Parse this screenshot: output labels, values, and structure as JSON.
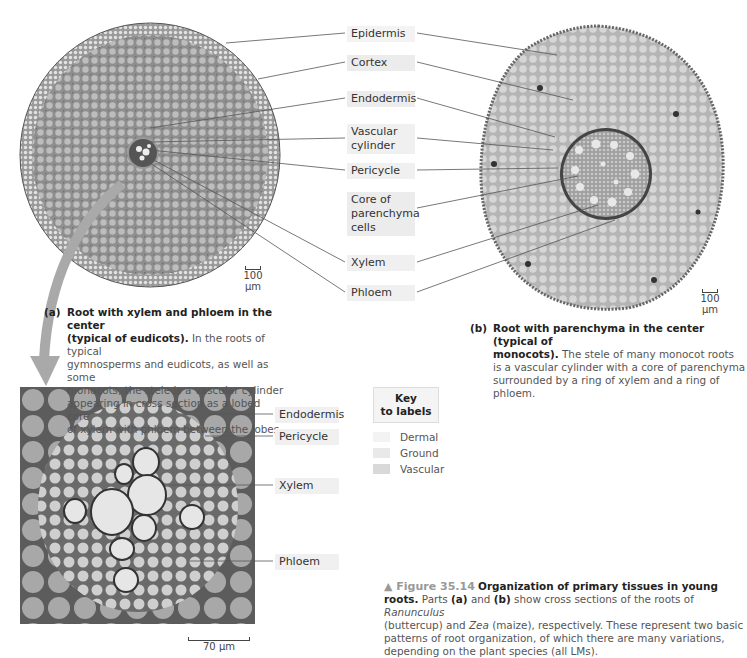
{
  "labels_center": {
    "epidermis": "Epidermis",
    "cortex": "Cortex",
    "endodermis": "Endodermis",
    "vascular_cylinder_1": "Vascular",
    "vascular_cylinder_2": "cylinder",
    "pericycle": "Pericycle",
    "core_1": "Core of",
    "core_2": "parenchyma",
    "core_3": "cells",
    "xylem": "Xylem",
    "phloem": "Phloem"
  },
  "panel_a": {
    "tag": "(a)",
    "title_1": "Root with xylem and phloem in the center",
    "title_2": "(typical of eudicots).",
    "text_1": "In the roots of typical",
    "text_2": "gymnosperms and eudicots, as well as some",
    "text_3": "monocots, the stele is a vascular cylinder",
    "text_4": "appearing in cross section as a lobed core",
    "text_5": "of xylem with phloem between the lobes.",
    "scale": "100 µm"
  },
  "panel_b": {
    "tag": "(b)",
    "title_1": "Root with parenchyma in the center (typical of",
    "title_2": "monocots).",
    "text_1": "The stele of many monocot roots",
    "text_2": "is a vascular cylinder with a core of parenchyma",
    "text_3": "surrounded by a ring of xylem and a ring of phloem.",
    "scale": "100 µm"
  },
  "micrograph": {
    "labels": {
      "endodermis": "Endodermis",
      "pericycle": "Pericycle",
      "xylem": "Xylem",
      "phloem": "Phloem"
    },
    "scale": "70 µm"
  },
  "key": {
    "title_1": "Key",
    "title_2": "to labels",
    "items": [
      {
        "label": "Dermal",
        "color": "#f3f3f3"
      },
      {
        "label": "Ground",
        "color": "#e9e9e9"
      },
      {
        "label": "Vascular",
        "color": "#d9d9d9"
      }
    ]
  },
  "figure_caption": {
    "marker": "▲ Figure 35.14",
    "title": "Organization of primary tissues in young",
    "title_2": "roots.",
    "line_1a": "Parts",
    "part_a": "(a)",
    "and": "and",
    "part_b": "(b)",
    "line_1b": "show cross sections of the roots of",
    "genus_1": "Ranunculus",
    "line_2a": "(buttercup) and",
    "genus_2": "Zea",
    "line_2b": "(maize), respectively. These represent two basic",
    "line_3": "patterns of root organization, of which there are many variations,",
    "line_4": "depending on the plant species (all LMs)."
  }
}
